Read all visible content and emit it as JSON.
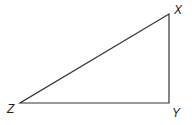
{
  "diagram": {
    "type": "triangle",
    "vertices": [
      {
        "label": "X",
        "x": 169,
        "y": 14
      },
      {
        "label": "Y",
        "x": 169,
        "y": 103
      },
      {
        "label": "Z",
        "x": 20,
        "y": 103
      }
    ],
    "labels": {
      "x": "X",
      "y": "Y",
      "z": "Z"
    },
    "stroke_color": "#333333"
  }
}
